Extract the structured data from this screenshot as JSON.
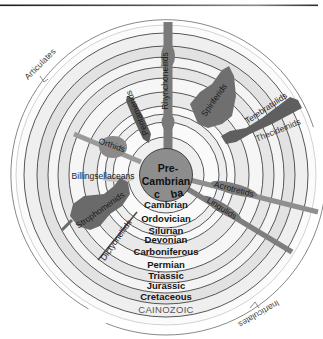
{
  "diagram": {
    "center": {
      "line1": "Pre-",
      "line2": "Cambrian",
      "sublabel_left": "c",
      "sublabel_right": "ba"
    },
    "periods": [
      {
        "label": "Cambrian"
      },
      {
        "label": "Ordovician"
      },
      {
        "label": "Silurian"
      },
      {
        "label": "Devonian"
      },
      {
        "label": "Carboniferous"
      },
      {
        "label": "Permian"
      },
      {
        "label": "Triassic"
      },
      {
        "label": "Jurassic"
      },
      {
        "label": "Cretaceous"
      }
    ],
    "era": {
      "label": "CAINOZOIC"
    },
    "groups": {
      "articulates": "Articulates",
      "inarticulates": "Inarticulates"
    },
    "taxa": {
      "rhynchonellids": "Rhynchonellids",
      "spiriferids": "Spiriferids",
      "terebratulids": "Terebratulids",
      "thecideinids": "Thecideinids",
      "pentamerids": "Pentamerids",
      "orthids": "Orthids",
      "billingsellaceans": "Billingsellaceans",
      "strophomenids": "Strophomenids",
      "dictyonellids": "Dictyonellids",
      "acrotretids": "Acrotretids",
      "lingulids": "Lingulids"
    },
    "colors": {
      "taxon_dark": "#6f6f6f",
      "taxon_mid": "#8c8c8c",
      "band_light": "#f6f6f6",
      "band_gray": "#e4e4e4",
      "center_fill": "#8d8d8d"
    }
  }
}
